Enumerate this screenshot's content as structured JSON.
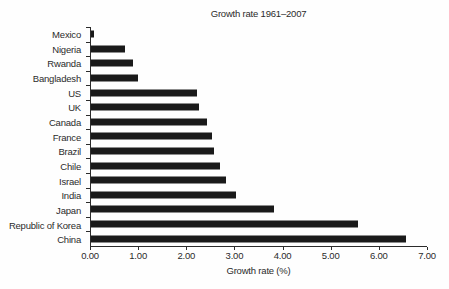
{
  "chart_data": {
    "type": "bar",
    "orientation": "horizontal",
    "title": "Growth rate 1961–2007",
    "xlabel": "Growth rate (%)",
    "categories": [
      "Mexico",
      "Nigeria",
      "Rwanda",
      "Bangladesh",
      "US",
      "UK",
      "Canada",
      "France",
      "Brazil",
      "Chile",
      "Israel",
      "India",
      "Japan",
      "Republic of Korea",
      "China"
    ],
    "values": [
      0.07,
      0.7,
      0.87,
      0.97,
      2.2,
      2.25,
      2.41,
      2.53,
      2.56,
      2.68,
      2.81,
      3.02,
      3.82,
      5.56,
      6.56
    ],
    "xlim": [
      0,
      7
    ],
    "x_ticks": [
      "0.00",
      "1.00",
      "2.00",
      "3.00",
      "4.00",
      "5.00",
      "6.00",
      "7.00"
    ],
    "grid": false,
    "bar_color": "#1a1a1a",
    "axis_color": "#2b2b2b",
    "text_color": "#2b2b2b",
    "background_color": "#fefefe"
  }
}
